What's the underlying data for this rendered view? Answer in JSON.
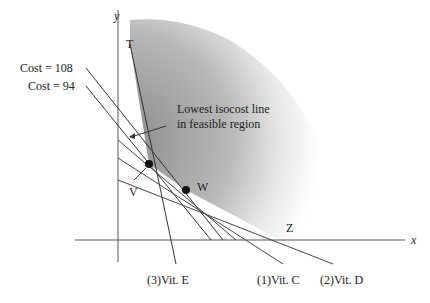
{
  "diagram": {
    "axes": {
      "x_label": "x",
      "y_label": "y"
    },
    "points": {
      "T": "T",
      "V": "V",
      "W": "W",
      "Z": "Z"
    },
    "annotations": {
      "cost_high": "Cost = 108",
      "cost_low": "Cost = 94",
      "lowest_line_1": "Lowest isocost line",
      "lowest_line_2": "in feasible region"
    },
    "constraints": {
      "vit_e": "(3)Vit. E",
      "vit_c": "(1)Vit. C",
      "vit_d": "(2)Vit. D"
    },
    "colors": {
      "shade_dark": "#8a8a8a",
      "line": "#333333"
    }
  }
}
